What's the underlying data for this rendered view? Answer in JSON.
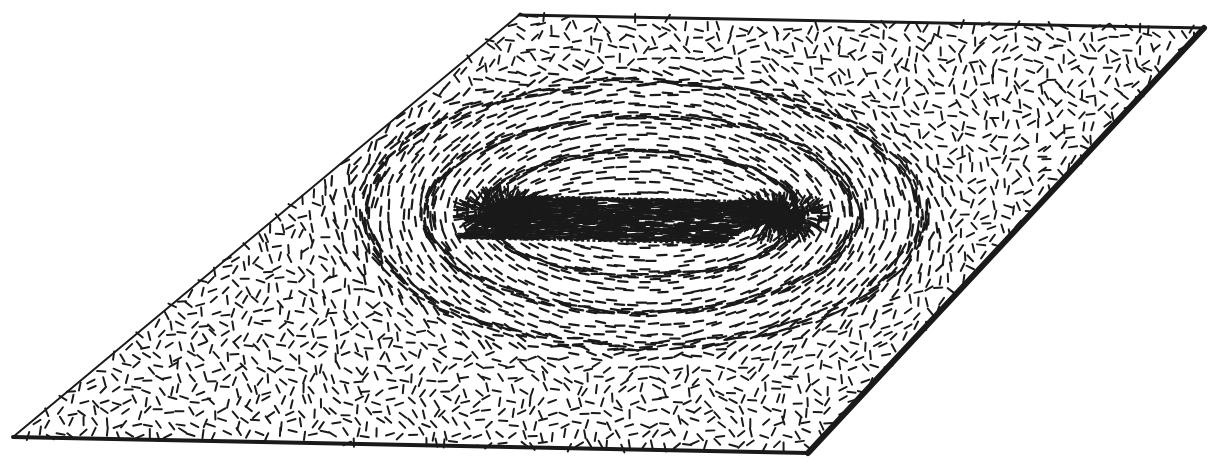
{
  "figure": {
    "title": "Director field on a tilted plane with two point defects",
    "domain": "scientific-diagram",
    "kind": "vector-field-tick-plot",
    "background_color": "#ffffff",
    "ink_color": "#1a1a1a",
    "caption": ""
  },
  "canvas": {
    "width": 1214,
    "height": 472
  },
  "plane": {
    "name": "tilted-parallelogram-plane",
    "stroke_color": "#1a1a1a",
    "edges": [
      {
        "name": "top-edge",
        "from": "top-left",
        "to": "top-right",
        "width_px": 3
      },
      {
        "name": "right-edge",
        "from": "top-right",
        "to": "bottom-right",
        "width_px": 6
      },
      {
        "name": "bottom-edge",
        "from": "bottom-right",
        "to": "bottom-left",
        "width_px": 4
      },
      {
        "name": "left-edge",
        "from": "bottom-left",
        "to": "top-left",
        "width_px": 2
      }
    ],
    "vertices": {
      "top_left": [
        519,
        15
      ],
      "top_right": [
        1204,
        28
      ],
      "bottom_right": [
        808,
        453
      ],
      "bottom_left": [
        13,
        437
      ]
    }
  },
  "inner_slab": {
    "name": "central-rectangular-inclusion",
    "description": "dense uniformly-aligned horizontal director region bounded by dotted edges",
    "vertices": {
      "top_left": [
        516,
        196
      ],
      "top_right": [
        782,
        202
      ],
      "bottom_right": [
        722,
        243
      ],
      "bottom_left": [
        458,
        238
      ]
    },
    "dotted_edges": [
      "top",
      "bottom"
    ],
    "fill_pattern": "horizontal-ticks-dense"
  },
  "defects": [
    {
      "name": "left-defect-core",
      "center": [
        505,
        212
      ],
      "charge": "+1",
      "type": "hedgehog-radial",
      "core_radius_px": 13
    },
    {
      "name": "right-defect-core",
      "center": [
        779,
        216
      ],
      "charge": "+1",
      "type": "hedgehog-radial",
      "core_radius_px": 13
    }
  ],
  "field_loops": [
    {
      "name": "loop-inner",
      "cx": 642,
      "cy": 214,
      "rx": 158,
      "ry": 62
    },
    {
      "name": "loop-middle",
      "cx": 642,
      "cy": 214,
      "rx": 215,
      "ry": 98
    },
    {
      "name": "loop-outer",
      "cx": 642,
      "cy": 214,
      "rx": 278,
      "ry": 132
    }
  ],
  "ticks": {
    "name": "director-ticks",
    "length_px": 9,
    "width_px": 2.1,
    "color": "#1a1a1a",
    "grid_spacing_px": 11,
    "jitter_px": 3.6,
    "far_field_randomness": 1.0,
    "near_field_randomness": 0.06,
    "count_estimate": 3600
  },
  "chart_data": {
    "type": "scatter",
    "title": "Director field on a tilted plane with two point defects",
    "xlabel": "",
    "ylabel": "",
    "series": [
      {
        "name": "defect-cores",
        "x": [
          505,
          779
        ],
        "y": [
          212,
          216
        ],
        "labels": [
          "left-defect-core",
          "right-defect-core"
        ]
      },
      {
        "name": "field-loop-semiaxes",
        "x": [
          158,
          215,
          278
        ],
        "y": [
          62,
          98,
          132
        ],
        "labels": [
          "loop-inner",
          "loop-middle",
          "loop-outer"
        ]
      }
    ],
    "grid": false,
    "legend": "none"
  }
}
